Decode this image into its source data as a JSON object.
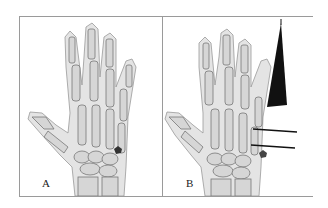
{
  "figure": {
    "panels": [
      {
        "label": "A",
        "description": "Dorsal hand skeleton with mark near ulnar carpal region"
      },
      {
        "label": "B",
        "description": "Dorsal hand skeleton with black triangular pointer and two horizontal lines at ulnar side"
      }
    ]
  }
}
